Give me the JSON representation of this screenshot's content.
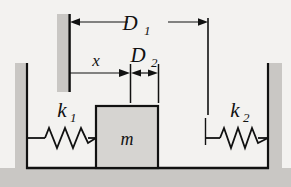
{
  "figure": {
    "background_color": "#f3f2f0",
    "ground_color": "#c9c7c4",
    "wall_color": "#c9c7c4",
    "block_color": "#d6d4d1",
    "line_color": "#111111"
  },
  "labels": {
    "d1_base": "D",
    "d1_sub": "1",
    "d2_base": "D",
    "d2_sub": "2",
    "x": "x",
    "k1_base": "k",
    "k1_sub": "1",
    "k2_base": "k",
    "k2_sub": "2",
    "mass": "m"
  },
  "elements": {
    "left_wall": "left-wall",
    "right_wall": "right-wall",
    "floor": "floor",
    "reference_post": "reference-post",
    "mass_block": "mass-block",
    "left_spring": "left-spring",
    "right_spring": "right-spring"
  },
  "dimensions": {
    "d1": {
      "name": "D1",
      "from_x": 70,
      "to_x": 208,
      "y": 22,
      "arrows": "both"
    },
    "d2": {
      "name": "D2",
      "from_x": 130,
      "to_x": 158,
      "y": 73,
      "arrows": "both"
    },
    "x": {
      "name": "x",
      "from_x": 70,
      "to_x": 128,
      "y": 73,
      "arrows": "right"
    }
  },
  "springs": {
    "k1": {
      "coils": 5,
      "x_start": 22,
      "x_end": 96,
      "y": 138
    },
    "k2": {
      "coils": 5,
      "x_start": 205,
      "x_end": 268,
      "y": 138
    }
  }
}
